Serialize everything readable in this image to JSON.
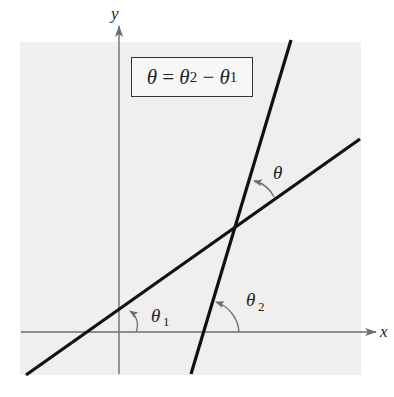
{
  "diagram": {
    "equation": {
      "lhs": "θ",
      "eq": " = ",
      "t2": "θ",
      "t2_sub": "2",
      "minus": " − ",
      "t1": "θ",
      "t1_sub": "1"
    },
    "axes": {
      "x_label": "x",
      "y_label": "y"
    },
    "angles": {
      "theta": "θ",
      "theta1": "θ",
      "theta1_sub": "1",
      "theta2": "θ",
      "theta2_sub": "2"
    },
    "lines": [
      {
        "name": "line-1",
        "description": "shallow line making angle θ1 with x-axis"
      },
      {
        "name": "line-2",
        "description": "steep line making angle θ2 with x-axis"
      }
    ],
    "colors": {
      "background": "#ffffff",
      "plot_area": "#efefef",
      "axes": "#6e6e6e",
      "lines": "#111111",
      "arcs": "#6e6e6e"
    }
  }
}
